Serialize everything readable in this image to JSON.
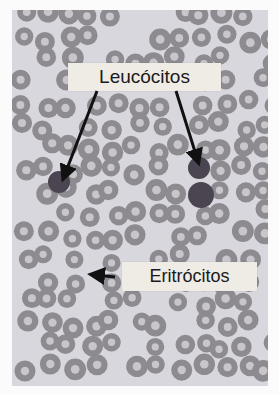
{
  "figure": {
    "type": "micrograph",
    "labels": [
      {
        "id": "leucocitos",
        "text": "Leucócitos",
        "arrows": 2
      },
      {
        "id": "eritrocitos",
        "text": "Eritrócitos",
        "arrows": 1
      }
    ]
  },
  "colors": {
    "background": "#d9d7de",
    "erythrocyte": "#8d8b90",
    "erythrocyte_center": "#c8c6cb",
    "leukocyte": "#4a4550",
    "label_box": "#efece6",
    "arrow": "#111111"
  }
}
